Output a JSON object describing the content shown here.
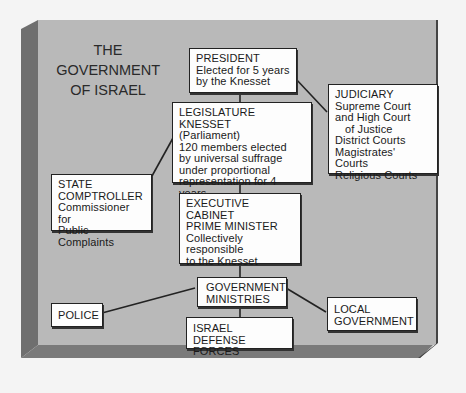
{
  "title": [
    "THE",
    "GOVERNMENT",
    "OF ISRAEL"
  ],
  "colors": {
    "panel_face": "#b9b9b9",
    "panel_left": "#6f6f6f",
    "panel_bottom": "#7a7a7a",
    "box_fill": "#fdfdfd",
    "line": "#222222"
  },
  "boxes": {
    "president": [
      "PRESIDENT",
      "Elected for 5 years",
      "by the Knesset"
    ],
    "legislature": [
      "LEGISLATURE KNESSET",
      "(Parliament)",
      "120 members elected",
      "by universal suffrage",
      "under proportional",
      "representation for 4 years"
    ],
    "judiciary": [
      "JUDICIARY",
      "Supreme Court",
      "and High Court",
      "of Justice",
      "District Courts",
      "Magistrates' Courts",
      "Religious Courts"
    ],
    "comptroller": [
      "STATE",
      "COMPTROLLER",
      "Commissioner for",
      "Public Complaints"
    ],
    "executive": [
      "EXECUTIVE CABINET",
      "PRIME MINISTER",
      "Collectively",
      "responsible",
      "to the Knesset"
    ],
    "ministries": [
      "GOVERNMENT",
      "MINISTRIES"
    ],
    "police": [
      "POLICE"
    ],
    "local_government": [
      "LOCAL",
      "GOVERNMENT"
    ],
    "idf": [
      "ISRAEL",
      "DEFENSE FORCES"
    ]
  }
}
